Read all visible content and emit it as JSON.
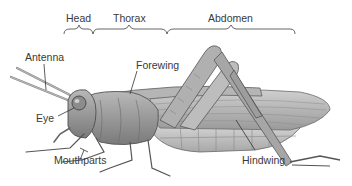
{
  "diagram": {
    "regions": [
      {
        "label": "Head"
      },
      {
        "label": "Thorax"
      },
      {
        "label": "Abdomen"
      }
    ],
    "parts": {
      "antenna": "Antenna",
      "forewing": "Forewing",
      "eye": "Eye",
      "mouthparts": "Mouthparts",
      "hindwing": "Hindwing"
    }
  },
  "colors": {
    "text": "#3a3a3a",
    "leader_line": "#333333",
    "body_dark": "#6e6e6e",
    "body_mid": "#a3a3a3",
    "body_light": "#d4d4d4",
    "background": "#ffffff"
  }
}
